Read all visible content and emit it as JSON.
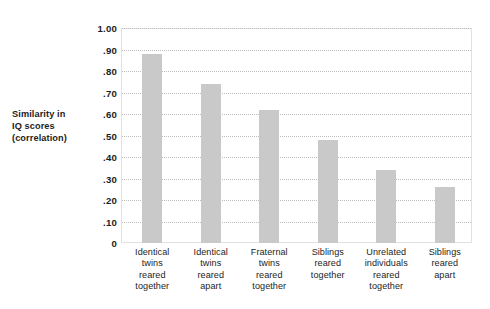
{
  "chart_data": {
    "type": "bar",
    "title": "",
    "subtitle": "",
    "xlabel": "",
    "ylabel": "Similarity in IQ scores (correlation)",
    "ylabel_lines": [
      "Similarity in",
      "IQ scores",
      "(correlation)"
    ],
    "ylim": [
      0,
      1.0
    ],
    "ytick_labels": [
      "1.00",
      ".90",
      ".80",
      ".70",
      ".60",
      ".50",
      ".40",
      ".30",
      ".20",
      ".10",
      "0"
    ],
    "ytick_values": [
      1.0,
      0.9,
      0.8,
      0.7,
      0.6,
      0.5,
      0.4,
      0.3,
      0.2,
      0.1,
      0
    ],
    "grid": true,
    "grid_style": "dotted",
    "legend": null,
    "legend_position": "none",
    "bar_color": "#c9c9c9",
    "grid_color": "#bdbdbd",
    "frame_color": "#e2e2e2",
    "text_color": "#1d1d1d",
    "categories": [
      "Identical twins reared together",
      "Identical twins reared apart",
      "Fraternal twins reared together",
      "Siblings reared together",
      "Unrelated individuals reared together",
      "Siblings reared apart"
    ],
    "category_lines": [
      [
        "Identical",
        "twins",
        "reared",
        "together"
      ],
      [
        "Identical",
        "twins",
        "reared",
        "apart"
      ],
      [
        "Fraternal",
        "twins",
        "reared",
        "together"
      ],
      [
        "Siblings",
        "reared",
        "together"
      ],
      [
        "Unrelated",
        "individuals",
        "reared",
        "together"
      ],
      [
        "Siblings",
        "reared",
        "apart"
      ]
    ],
    "values": [
      0.88,
      0.74,
      0.62,
      0.48,
      0.34,
      0.26
    ]
  }
}
